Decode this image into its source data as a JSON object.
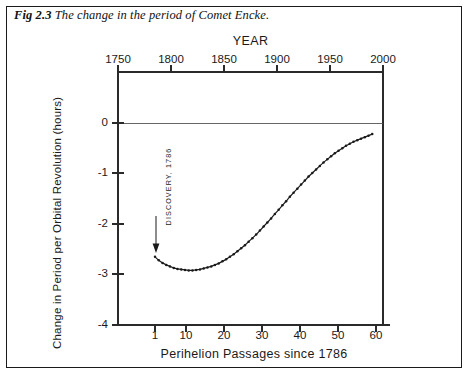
{
  "caption": {
    "figure_number": "Fig 2.3",
    "text": "The change in the period of Comet Encke."
  },
  "annotation": {
    "discovery_label": "DISCOVERY, 1786"
  },
  "chart_data": {
    "type": "line",
    "title": "The change in the period of Comet Encke.",
    "xlabel": "Perihelion Passages since 1786",
    "ylabel": "Change in Period per Orbital Revolution (hours)",
    "top_axis_label": "YEAR",
    "xlim": [
      0,
      64
    ],
    "ylim": [
      -4,
      0.6
    ],
    "grid": false,
    "legend": "none",
    "xticks": [
      1,
      10,
      20,
      30,
      40,
      50,
      60
    ],
    "xtick_labels": [
      "1",
      "10",
      "20",
      "30",
      "40",
      "50",
      "60"
    ],
    "yticks": [
      0,
      -1,
      -2,
      -3,
      -4
    ],
    "ytick_labels": [
      "0",
      "-1",
      "-2",
      "-3",
      "-4"
    ],
    "top_xticks": [
      1750,
      1800,
      1850,
      1900,
      1950,
      2000
    ],
    "top_xtick_labels": [
      "1750",
      "1800",
      "1850",
      "1900",
      "1950",
      "2000"
    ],
    "top_xlim": [
      1750,
      2000
    ],
    "annotations": [
      {
        "text": "DISCOVERY, 1786",
        "x": 1,
        "y": -2.65
      }
    ],
    "x": [
      1,
      2,
      3,
      4,
      5,
      6,
      7,
      8,
      9,
      10,
      11,
      12,
      13,
      14,
      15,
      16,
      17,
      18,
      19,
      20,
      21,
      22,
      23,
      24,
      25,
      26,
      27,
      28,
      29,
      30,
      31,
      32,
      33,
      34,
      35,
      36,
      37,
      38,
      39,
      40,
      41,
      42,
      43,
      44,
      45,
      46,
      47,
      48,
      49,
      50,
      51,
      52,
      53,
      54,
      55,
      56,
      57,
      58,
      59
    ],
    "values": [
      -2.65,
      -2.72,
      -2.77,
      -2.81,
      -2.84,
      -2.87,
      -2.89,
      -2.9,
      -2.91,
      -2.92,
      -2.92,
      -2.91,
      -2.9,
      -2.88,
      -2.86,
      -2.84,
      -2.81,
      -2.78,
      -2.74,
      -2.7,
      -2.65,
      -2.6,
      -2.54,
      -2.48,
      -2.42,
      -2.35,
      -2.28,
      -2.21,
      -2.13,
      -2.05,
      -1.97,
      -1.89,
      -1.8,
      -1.72,
      -1.63,
      -1.55,
      -1.46,
      -1.38,
      -1.3,
      -1.22,
      -1.14,
      -1.06,
      -0.99,
      -0.92,
      -0.85,
      -0.78,
      -0.72,
      -0.66,
      -0.6,
      -0.55,
      -0.5,
      -0.45,
      -0.41,
      -0.37,
      -0.34,
      -0.31,
      -0.28,
      -0.25,
      -0.22
    ]
  }
}
